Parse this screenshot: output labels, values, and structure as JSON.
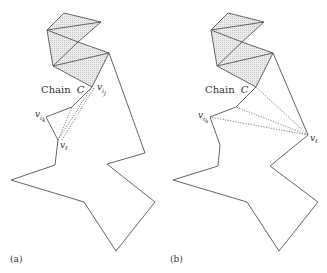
{
  "panels": [
    {
      "id": "a",
      "label": "(a)",
      "chain_label": "Chain",
      "chain_symbol": "C",
      "vertex_labels": {
        "v_ij": {
          "base": "v",
          "sub": "i",
          "subsub": "j"
        },
        "v_ik": {
          "base": "v",
          "sub": "i",
          "subsub": "k"
        },
        "v_l": {
          "base": "v",
          "sub": "ℓ"
        }
      },
      "dotted_edges_from": "v_ℓ",
      "dotted_edges_to": [
        "v_ij",
        "middle-vertex"
      ]
    },
    {
      "id": "b",
      "label": "(b)",
      "chain_label": "Chain",
      "chain_symbol": "C",
      "vertex_labels": {
        "v_ik": {
          "base": "v",
          "sub": "i",
          "subsub": "k"
        },
        "v_l": {
          "base": "v",
          "sub": "ℓ"
        }
      },
      "dotted_edges_from": "v_ℓ",
      "dotted_edges_to": [
        "v_ij",
        "middle-vertex",
        "v_ik"
      ]
    }
  ],
  "colors": {
    "stroke": "#555555",
    "triangulated_fill": "#e4e4e4",
    "background": "#ffffff"
  }
}
